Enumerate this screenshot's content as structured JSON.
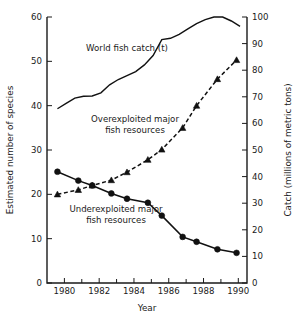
{
  "chart_data": {
    "type": "line",
    "title": "",
    "xlabel": "Year",
    "ylabel": "Estimated number of species",
    "y2label": "Catch (millions of metric tons)",
    "xlim": [
      1979,
      1990.5
    ],
    "ylim": [
      0,
      60
    ],
    "y2lim": [
      0,
      100
    ],
    "xticks": [
      1980,
      1982,
      1984,
      1986,
      1988,
      1990
    ],
    "xticklabels": [
      "1980",
      "1982",
      "1984",
      "1986",
      "1988",
      "1990"
    ],
    "xminorticks": [
      1981,
      1983,
      1985,
      1987,
      1989
    ],
    "yticks": [
      0,
      10,
      20,
      30,
      40,
      50,
      60
    ],
    "yticklabels": [
      "0",
      "10",
      "20",
      "30",
      "40",
      "50",
      "60"
    ],
    "y2ticks": [
      0,
      10,
      20,
      30,
      40,
      50,
      60,
      70,
      80,
      90,
      100
    ],
    "y2ticklabels": [
      "0",
      "10",
      "20",
      "30",
      "40",
      "50",
      "60",
      "70",
      "80",
      "90",
      "100"
    ],
    "grid": false,
    "legend": "inline-annotations",
    "series": [
      {
        "name": "World fish catch (t)",
        "axis": "right",
        "style": "solid",
        "marker": "none",
        "x": [
          1979.6,
          1980.1,
          1980.6,
          1981.1,
          1981.6,
          1982.1,
          1982.6,
          1983.1,
          1983.6,
          1984.1,
          1984.6,
          1985.1,
          1985.6,
          1986.1,
          1986.6,
          1987.1,
          1987.6,
          1988.1,
          1988.6,
          1989.1,
          1989.6,
          1990.1
        ],
        "values": [
          65.5,
          67.5,
          69.5,
          70.2,
          70.3,
          71.5,
          74.5,
          76.5,
          78.0,
          79.5,
          82.0,
          85.5,
          91.5,
          92.0,
          93.5,
          95.5,
          97.5,
          99.0,
          100.0,
          100.0,
          98.5,
          96.5
        ]
      },
      {
        "name": "Overexploited major fish resources",
        "axis": "left",
        "style": "dashed",
        "marker": "triangle",
        "x": [
          1979.6,
          1980.8,
          1981.6,
          1982.7,
          1983.6,
          1984.8,
          1985.6,
          1986.8,
          1987.6,
          1988.8,
          1989.9
        ],
        "values": [
          20.0,
          21.0,
          22.0,
          23.2,
          25.0,
          27.8,
          30.1,
          35.0,
          40.0,
          46.0,
          50.3
        ]
      },
      {
        "name": "Underexploited major fish resources",
        "axis": "left",
        "style": "solid",
        "marker": "circle",
        "x": [
          1979.6,
          1980.8,
          1981.6,
          1982.7,
          1983.6,
          1984.8,
          1985.6,
          1986.8,
          1987.6,
          1988.8,
          1989.9
        ],
        "values": [
          25.1,
          23.1,
          22.0,
          20.2,
          19.0,
          18.1,
          15.2,
          10.4,
          9.3,
          7.6,
          6.8
        ]
      }
    ],
    "annotations": [
      {
        "name": "world-fish-catch-label",
        "lines": [
          "World fish catch (t)"
        ],
        "x": 127,
        "y": 51,
        "anchor": "middle"
      },
      {
        "name": "overexploited-label",
        "lines": [
          "Overexploited major",
          "fish resources"
        ],
        "x": 135,
        "y": 122,
        "anchor": "middle"
      },
      {
        "name": "underexploited-label",
        "lines": [
          "Underexploited major",
          "fish resources"
        ],
        "x": 116,
        "y": 212,
        "anchor": "middle"
      }
    ],
    "colors": {
      "axis": "#1a1a1a",
      "line": "#111111",
      "marker": "#111111",
      "background": "#ffffff"
    }
  }
}
